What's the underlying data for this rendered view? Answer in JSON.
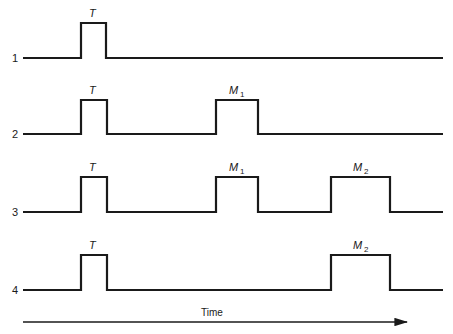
{
  "diagram": {
    "type": "timing-diagram",
    "rows": [
      {
        "label": "1",
        "pulses": [
          {
            "name": "T",
            "sub": "",
            "x0": 81,
            "x1": 106
          }
        ]
      },
      {
        "label": "2",
        "pulses": [
          {
            "name": "T",
            "sub": "",
            "x0": 81,
            "x1": 107
          },
          {
            "name": "M",
            "sub": "1",
            "x0": 216,
            "x1": 258
          }
        ]
      },
      {
        "label": "3",
        "pulses": [
          {
            "name": "T",
            "sub": "",
            "x0": 81,
            "x1": 107
          },
          {
            "name": "M",
            "sub": "1",
            "x0": 216,
            "x1": 258
          },
          {
            "name": "M",
            "sub": "2",
            "x0": 331,
            "x1": 390
          }
        ]
      },
      {
        "label": "4",
        "pulses": [
          {
            "name": "T",
            "sub": "",
            "x0": 81,
            "x1": 107
          },
          {
            "name": "M",
            "sub": "2",
            "x0": 331,
            "x1": 390
          }
        ]
      }
    ],
    "time_axis": {
      "label": "Time",
      "direction": "right"
    },
    "colors": {
      "ink": "#1a1a1a",
      "background": "#ffffff"
    }
  }
}
